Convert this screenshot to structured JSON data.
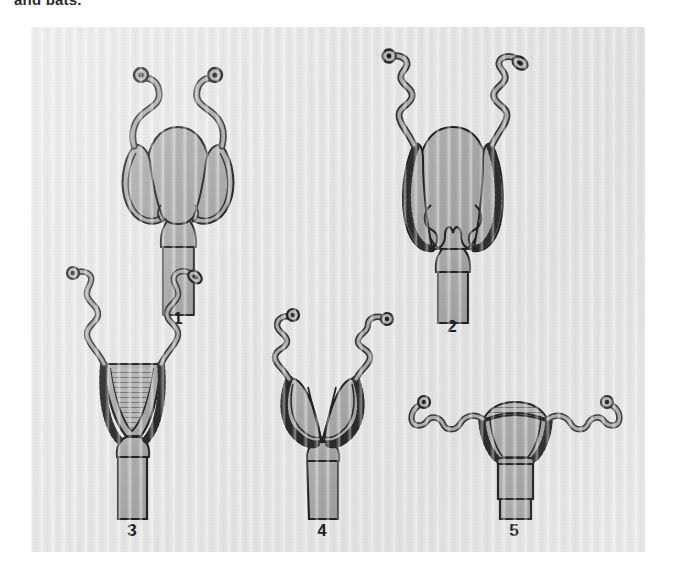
{
  "page": {
    "cutoff_caption": "and bats.",
    "background_color": "#ffffff"
  },
  "figure": {
    "panel_background": "#e7e7e7",
    "organ_fill": "#a9a9a9",
    "organ_fill_light": "#b4b4b4",
    "outline_color": "#262626",
    "panel_bounds": {
      "left": 31,
      "top": 27,
      "width": 614,
      "height": 525
    },
    "figures": [
      {
        "number": "1",
        "name": "duplex-uterus",
        "label_x": 147,
        "label_y": 291,
        "parts": [
          "ovary",
          "oviduct",
          "uterine-horn",
          "uterus-body",
          "cervix",
          "vagina"
        ]
      },
      {
        "number": "2",
        "name": "bicornuate-uterus-long-horns",
        "label_x": 421,
        "label_y": 299,
        "parts": [
          "ovary",
          "coiled-oviduct",
          "uterine-horn",
          "uterus-body",
          "cervix",
          "vagina"
        ]
      },
      {
        "number": "3",
        "name": "bipartite-uterus",
        "label_x": 101,
        "label_y": 501,
        "parts": [
          "ovary",
          "coiled-oviduct",
          "uterine-horn",
          "septum",
          "cervix",
          "vagina"
        ]
      },
      {
        "number": "4",
        "name": "bicornuate-uterus-deep-cleft",
        "label_x": 291,
        "label_y": 501,
        "parts": [
          "ovary",
          "coiled-oviduct",
          "uterine-horn",
          "uterus-body",
          "cervix",
          "vagina"
        ]
      },
      {
        "number": "5",
        "name": "simplex-uterus",
        "label_x": 483,
        "label_y": 501,
        "parts": [
          "ovary",
          "coiled-oviduct",
          "fundus",
          "uterus-body",
          "cervix",
          "vagina"
        ]
      }
    ]
  }
}
